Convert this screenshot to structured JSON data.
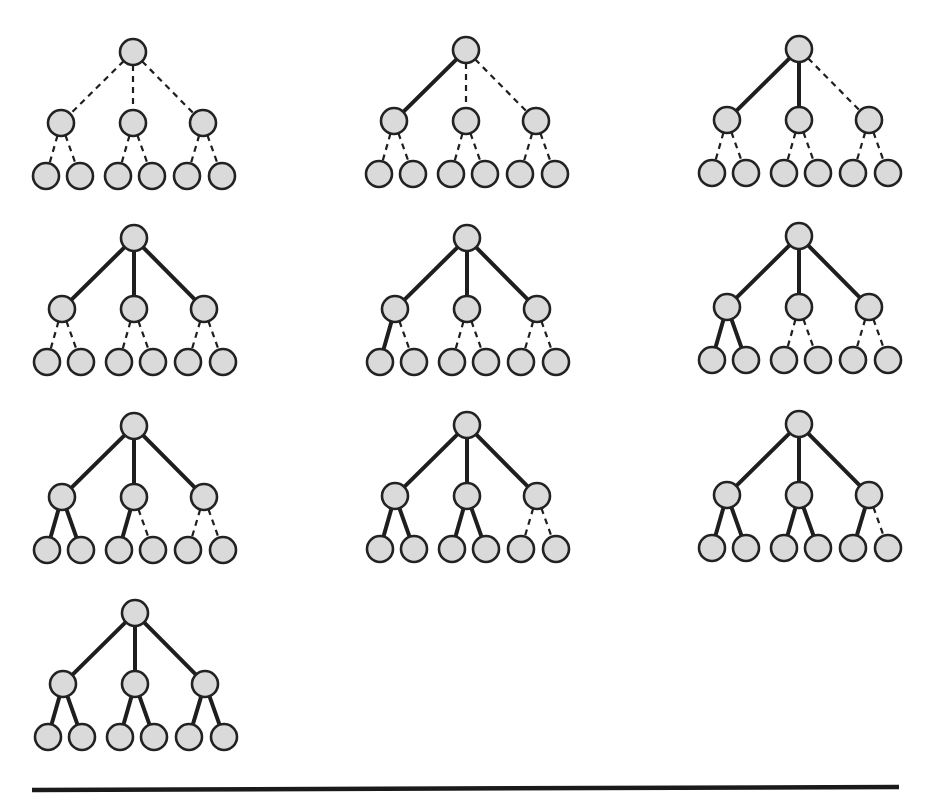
{
  "diagram": {
    "type": "tree-sequence",
    "colors": {
      "node_fill": "#dadada",
      "node_stroke": "#222222",
      "edge": "#1e1e1e",
      "background": "#ffffff"
    },
    "node_radius": 13,
    "layout": {
      "child_offsets_x": [
        -72,
        0,
        70
      ],
      "child_offset_y": 71,
      "leaf_offsets_x": [
        -87,
        -53,
        -15,
        19,
        54,
        89
      ],
      "leaf_offset_y": 124,
      "leaf_parent": [
        0,
        0,
        1,
        1,
        2,
        2
      ]
    },
    "edge_order": [
      "root-c1",
      "root-c2",
      "root-c3",
      "c1-l1",
      "c1-l2",
      "c2-l3",
      "c2-l4",
      "c3-l5",
      "c3-l6"
    ],
    "trees": [
      {
        "id": 1,
        "root": [
          133,
          52
        ],
        "solid_edges": 0
      },
      {
        "id": 2,
        "root": [
          466,
          50
        ],
        "solid_edges": 1
      },
      {
        "id": 3,
        "root": [
          799,
          49
        ],
        "solid_edges": 2
      },
      {
        "id": 4,
        "root": [
          134,
          238
        ],
        "solid_edges": 3
      },
      {
        "id": 5,
        "root": [
          467,
          238
        ],
        "solid_edges": 4
      },
      {
        "id": 6,
        "root": [
          799,
          236
        ],
        "solid_edges": 5
      },
      {
        "id": 7,
        "root": [
          134,
          426
        ],
        "solid_edges": 6
      },
      {
        "id": 8,
        "root": [
          467,
          425
        ],
        "solid_edges": 7
      },
      {
        "id": 9,
        "root": [
          799,
          424
        ],
        "solid_edges": 8
      },
      {
        "id": 10,
        "root": [
          135,
          613
        ],
        "solid_edges": 9
      }
    ],
    "bottom_rule": {
      "x1": 32,
      "y1": 790,
      "x2": 899,
      "y2": 787
    }
  }
}
